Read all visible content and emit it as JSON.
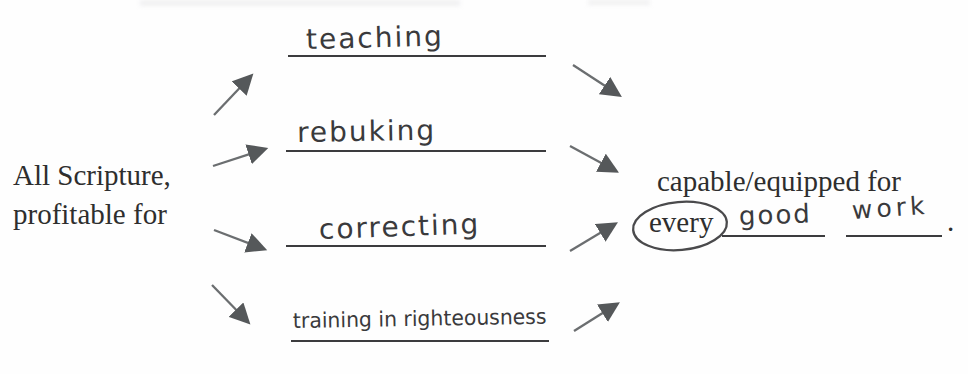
{
  "diagram": {
    "left_label": {
      "line1": "All Scripture,",
      "line2": "profitable for"
    },
    "blanks": [
      {
        "answer": "teaching"
      },
      {
        "answer": "rebuking"
      },
      {
        "answer": "correcting"
      },
      {
        "answer": "training in righteousness"
      }
    ],
    "right_label": {
      "line1": "capable/equipped for",
      "circled_word": "every",
      "blank1_answer": "good",
      "blank2_answer": "work",
      "punctuation": "."
    },
    "colors": {
      "printed_ink": "#2e2e2e",
      "handwriting_ink": "#3a3a3c",
      "blank_line": "#3c3c3e",
      "arrow": "#6b6e70",
      "arrowhead": "#55585a",
      "background": "#fefefe"
    }
  }
}
